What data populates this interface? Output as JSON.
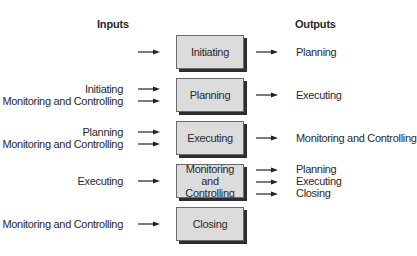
{
  "headers": {
    "inputs": "Inputs",
    "outputs": "Outputs"
  },
  "processes": [
    {
      "name": "Initiating",
      "inputs": [],
      "outputs": [
        "Planning"
      ]
    },
    {
      "name": "Planning",
      "inputs": [
        "Initiating",
        "Monitoring and Controlling"
      ],
      "outputs": [
        "Executing"
      ]
    },
    {
      "name": "Executing",
      "inputs": [
        "Planning",
        "Monitoring and Controlling"
      ],
      "outputs": [
        "Monitoring and Controlling"
      ]
    },
    {
      "name": "Monitoring and Controlling",
      "inputs": [
        "Executing"
      ],
      "outputs": [
        "Planning",
        "Executing",
        "Closing"
      ]
    },
    {
      "name": "Closing",
      "inputs": [
        "Monitoring and Controlling"
      ],
      "outputs": []
    }
  ]
}
